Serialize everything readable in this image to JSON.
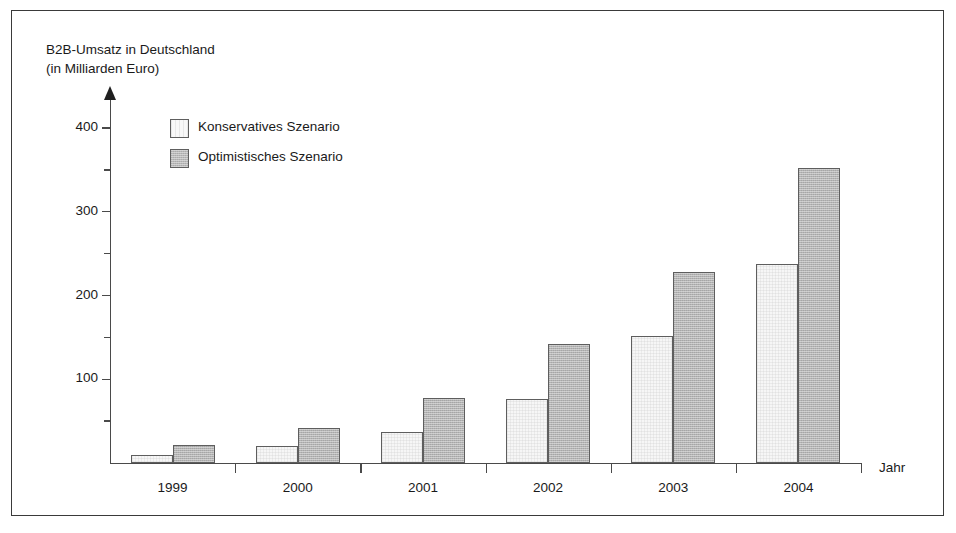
{
  "chart_data": {
    "type": "bar",
    "title": "B2B-Umsatz in Deutschland (in Milliarden Euro)",
    "title_line1": "B2B-Umsatz in Deutschland",
    "title_line2": "(in Milliarden Euro)",
    "xlabel": "Jahr",
    "ylabel": "",
    "categories": [
      "1999",
      "2000",
      "2001",
      "2002",
      "2003",
      "2004"
    ],
    "series": [
      {
        "name": "Konservatives Szenario",
        "values": [
          10,
          20,
          37,
          76,
          152,
          238
        ],
        "color": "#f6f6f6"
      },
      {
        "name": "Optimistisches Szenario",
        "values": [
          22,
          42,
          78,
          142,
          228,
          352
        ],
        "color": "#b4b4b4"
      }
    ],
    "ylim": [
      0,
      430
    ],
    "y_major_ticks": [
      100,
      200,
      300,
      400
    ],
    "y_minor_ticks": [
      50,
      150,
      250,
      350
    ],
    "y_tick_labels": [
      "100",
      "200",
      "300",
      "400"
    ],
    "grid": false,
    "legend_position": "top-left-inside",
    "axis_color": "#4a4a4a",
    "frame_color": "#3a3a3a"
  },
  "legend": {
    "entries": [
      {
        "label": "Konservatives Szenario",
        "style": "cons"
      },
      {
        "label": "Optimistisches Szenario",
        "style": "opt"
      }
    ]
  }
}
